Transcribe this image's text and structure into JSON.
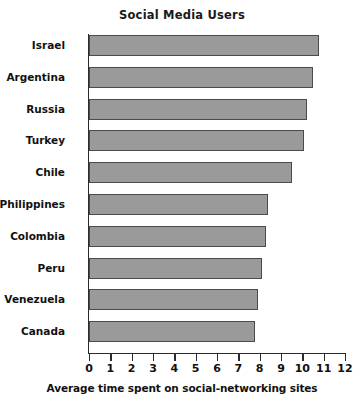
{
  "chart_data": {
    "type": "bar",
    "orientation": "horizontal",
    "title": "Social Media Users",
    "xlabel": "Average time spent on social-networking sites",
    "ylabel": "",
    "xlim": [
      0,
      12
    ],
    "xticks": [
      "0",
      "1",
      "2",
      "3",
      "4",
      "5",
      "6",
      "7",
      "8",
      "9",
      "10",
      "11",
      "12"
    ],
    "grid": false,
    "legend": null,
    "categories": [
      "Israel",
      "Argentina",
      "Russia",
      "Turkey",
      "Chile",
      "Philippines",
      "Colombia",
      "Peru",
      "Venezuela",
      "Canada"
    ],
    "values": [
      10.8,
      10.5,
      10.2,
      10.1,
      9.5,
      8.4,
      8.3,
      8.1,
      7.9,
      7.8
    ],
    "bar_color": "#9a9a9a",
    "bar_border_color": "#4a4a4a"
  }
}
